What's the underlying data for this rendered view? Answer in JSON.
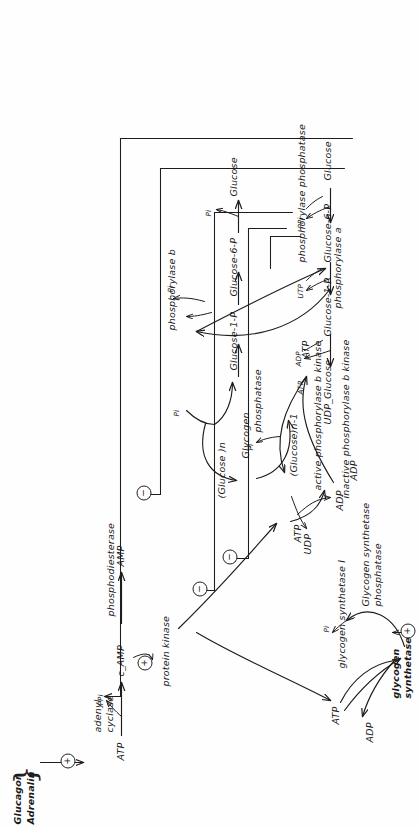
{
  "document": {
    "title": "Hormonal regulation of glycogen metabolism (hand-drawn)",
    "orientation": "rotated-90-ccw",
    "ink_color": "#1a1a1a",
    "paper_color": "#fefefe"
  },
  "symbols": {
    "activation": "+",
    "inhibition": "−",
    "arrow": "→"
  },
  "hormones": {
    "line1": "Glucagon",
    "line2": "Adrenalin",
    "brace": "}"
  },
  "camp_branch": {
    "substrate": "ATP",
    "enzyme_line1": "adenyl",
    "enzyme_line2": "cyclase",
    "byproduct": "PPi",
    "product": "c_AMP",
    "effector_sign": "+",
    "hormone_effector_sign": "+",
    "target": "protein kinase",
    "phosphodiesterase": "phosphodiesterase",
    "amp": "AMP"
  },
  "kinase_cycle": {
    "inactive": "inactive phosphorylase b kinase",
    "active": "active phosphorylase b kinase",
    "atp": "ATP",
    "adp": "ADP",
    "pi": "Pi",
    "phosphatase": "phosphatase"
  },
  "phosphorylase_cycle": {
    "atp": "ATP",
    "adp": "ADP",
    "form_a": "phosphorylase a",
    "form_b": "phosphorylase b",
    "pi": "Pi",
    "phosphatase": "phosphorylase phosphatase",
    "inhibit_sign_1": "−",
    "inhibit_sign_2": "−",
    "inhibit_sign_3": "−"
  },
  "glycogen_cycle": {
    "center_label": "Glycogen",
    "glucose_n": "(Glucose )n",
    "glucose_n_minus_1": "(Glucose)n-1",
    "pi": "Pi",
    "udp": "UDP"
  },
  "degradation_chain": {
    "steps": [
      "Glucose-1-P",
      "Glucose-6-P",
      "Glucose"
    ],
    "pi_release": "Pi"
  },
  "synthesis_chain": {
    "steps": [
      "UDP_Glucose",
      "Glucose-1-P",
      "Glucose-6-P",
      "Glucose"
    ],
    "cofactors": [
      "PPi",
      "UTP",
      "ADP",
      "ATP"
    ]
  },
  "synthetase_cycle": {
    "form_i": "glycogen synthetase I",
    "form_d_line1": "glycogen",
    "form_d_line2": "synthetase D",
    "atp": "ATP",
    "adp": "ADP",
    "pi": "Pi",
    "phosphatase_line1": "Glycogen synthetase",
    "phosphatase_line2": "phosphatase",
    "activate_sign": "+",
    "inhibit_sign": "−"
  }
}
